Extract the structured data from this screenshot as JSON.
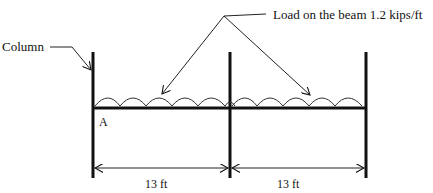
{
  "labels": {
    "column": "Column",
    "load": "Load on the beam 1.2 kips/ft",
    "support_a": "A",
    "span_1": "13 ft",
    "span_2": "13 ft"
  },
  "structure": {
    "spans": 2,
    "span_length_ft": 13,
    "distributed_load_kips_per_ft": 1.2,
    "load_arcs_per_span": 5
  },
  "colors": {
    "line": "#111111",
    "background": "#ffffff"
  }
}
